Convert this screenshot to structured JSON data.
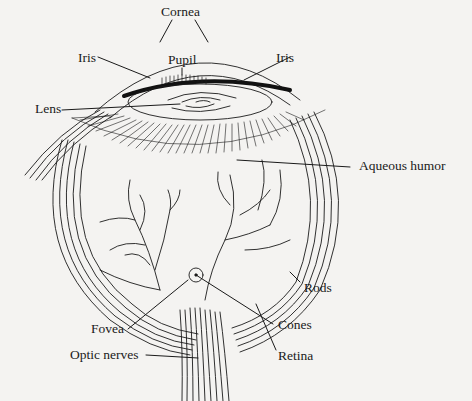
{
  "diagram": {
    "labels": {
      "cornea": "Cornea",
      "iris_left": "Iris",
      "pupil": "Pupil",
      "iris_right": "Iris",
      "lens": "Lens",
      "aqueous_humor": "Aqueous humor",
      "rods": "Rods",
      "fovea": "Fovea",
      "cones": "Cones",
      "optic_nerves": "Optic nerves",
      "retina": "Retina"
    },
    "colors": {
      "background": "#f4f3f1",
      "ink": "#1a1a1a"
    }
  }
}
